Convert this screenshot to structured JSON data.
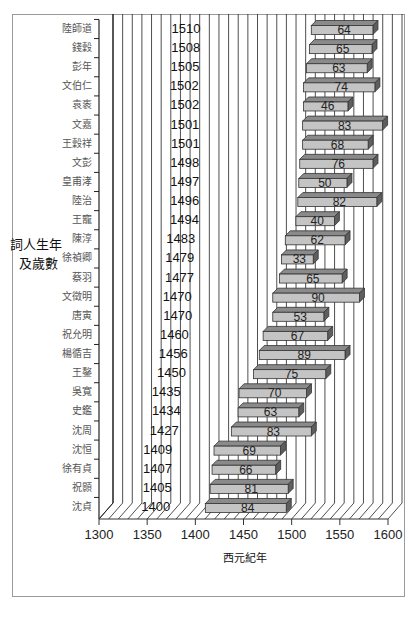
{
  "chart_data": {
    "type": "bar",
    "orientation": "horizontal",
    "style": "3d-floating-bar (timeline)",
    "title": "",
    "xlabel": "西元紀年",
    "ylabel": "詞人生年及歲數",
    "ylabel_lines": [
      "詞人生年",
      "及歲數"
    ],
    "xlim": [
      1300,
      1600
    ],
    "xticks": [
      1300,
      1350,
      1400,
      1450,
      1500,
      1550,
      1600
    ],
    "grid": "vertical every 10 years",
    "legend": "none",
    "categories": [
      "陸師道",
      "錢穀",
      "彭年",
      "文伯仁",
      "袁袠",
      "文嘉",
      "王穀祥",
      "文彭",
      "皇甫涍",
      "陸治",
      "王寵",
      "陳淳",
      "徐禎卿",
      "蔡羽",
      "文徵明",
      "唐寅",
      "祝允明",
      "楊循吉",
      "王鏊",
      "吳寬",
      "史鑑",
      "沈周",
      "沈恒",
      "徐有貞",
      "祝顥",
      "沈貞"
    ],
    "series": [
      {
        "name": "生年",
        "values": [
          1510,
          1508,
          1505,
          1502,
          1502,
          1501,
          1501,
          1498,
          1497,
          1496,
          1494,
          1483,
          1479,
          1477,
          1470,
          1470,
          1460,
          1456,
          1450,
          1435,
          1434,
          1427,
          1409,
          1407,
          1405,
          1400
        ]
      },
      {
        "name": "歲數",
        "values": [
          64,
          65,
          63,
          74,
          46,
          83,
          68,
          76,
          50,
          82,
          40,
          62,
          33,
          65,
          90,
          53,
          67,
          89,
          75,
          70,
          63,
          83,
          69,
          66,
          81,
          84
        ]
      }
    ],
    "colors": {
      "bar_face": "#c4c4c4",
      "bar_top": "#8a8a8a",
      "bar_side": "#5e5e5e",
      "bar_edge": "#333333",
      "grid": "#222222",
      "frame": "#9a9a9a"
    }
  }
}
